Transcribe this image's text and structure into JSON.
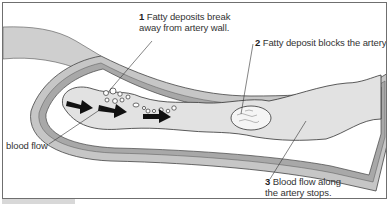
{
  "diagram": {
    "labels": {
      "label1": {
        "number": "1",
        "line1": "Fatty deposits break",
        "line2": "away from artery wall."
      },
      "label2": {
        "number": "2",
        "text": "Fatty deposit blocks the artery."
      },
      "label3": {
        "number": "3",
        "line1": "Blood flow along",
        "line2": "the artery stops."
      },
      "blood_flow": {
        "text": "blood flow"
      }
    },
    "colors": {
      "wall_outer": "#c9c9c9",
      "wall_band": "#a9a9a9",
      "lumen": "#e4e4e4",
      "tissue": "#ffffff",
      "deposit": "#f4f4f4",
      "arrow": "#111111",
      "outline": "#333333"
    },
    "icons": [
      "arrow-right-icon",
      "arrow-right-icon",
      "arrow-right-icon"
    ]
  }
}
